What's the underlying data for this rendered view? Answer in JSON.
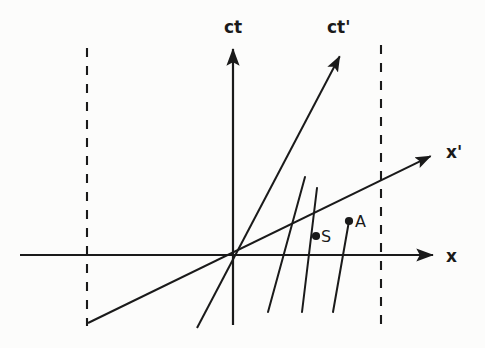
{
  "figure": {
    "kind": "minkowski-spacetime-diagram",
    "background_color": "#fcfcfb",
    "ink_color": "#1a1a1a",
    "width": 485,
    "height": 348
  },
  "labels": {
    "ct": "ct",
    "ct_prime": "ct'",
    "x": "x",
    "x_prime": "x'",
    "point_s": "S",
    "point_a": "A"
  },
  "chart_data": {
    "type": "line",
    "title": "",
    "xlabel": "x",
    "ylabel": "ct",
    "axes": [
      {
        "name": "ct-axis",
        "label": "ct",
        "style": "solid-arrow",
        "from": [
          233,
          325
        ],
        "to": [
          233,
          42
        ]
      },
      {
        "name": "x-axis",
        "label": "x",
        "style": "solid-arrow",
        "from": [
          20,
          255
        ],
        "to": [
          440,
          255
        ]
      },
      {
        "name": "ct-prime-axis",
        "label": "ct'",
        "style": "solid-arrow",
        "from": [
          197,
          328
        ],
        "to": [
          343,
          50
        ]
      },
      {
        "name": "x-prime-axis",
        "label": "x'",
        "style": "solid-arrow",
        "from": [
          88,
          323
        ],
        "to": [
          437,
          153
        ]
      }
    ],
    "boundaries": [
      {
        "name": "left-boundary",
        "style": "dashed-vertical",
        "x": 87,
        "y_from": 48,
        "y_to": 326
      },
      {
        "name": "right-boundary",
        "style": "dashed-vertical",
        "x": 381,
        "y_from": 45,
        "y_to": 326
      }
    ],
    "worldlines": [
      {
        "name": "worldline-1",
        "style": "solid",
        "from": [
          305,
          177
        ],
        "to": [
          268,
          312
        ]
      },
      {
        "name": "worldline-2",
        "style": "solid",
        "from": [
          317,
          188
        ],
        "to": [
          302,
          312
        ]
      },
      {
        "name": "worldline-3",
        "style": "solid",
        "from": [
          349,
          221
        ],
        "to": [
          333,
          312
        ]
      }
    ],
    "events": [
      {
        "name": "event-s",
        "label": "S",
        "marker": "filled-dot",
        "position": [
          316,
          236
        ],
        "label_position": [
          321,
          242
        ]
      },
      {
        "name": "event-a",
        "label": "A",
        "marker": "filled-dot",
        "position": [
          349,
          221
        ],
        "label_position": [
          355,
          227
        ]
      }
    ],
    "label_positions": {
      "ct": [
        224,
        33
      ],
      "ct_prime": [
        327,
        33
      ],
      "x": [
        446,
        262
      ],
      "x_prime": [
        446,
        158
      ]
    },
    "grid": false,
    "legend": null
  }
}
